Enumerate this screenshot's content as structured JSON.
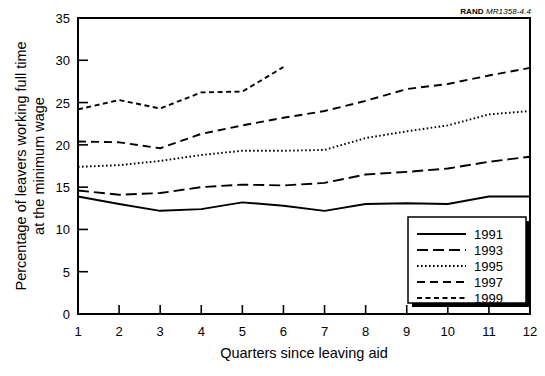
{
  "source_label": {
    "org": "RAND",
    "code": "MR1358-4.4"
  },
  "chart_data": {
    "type": "line",
    "title": "",
    "xlabel": "Quarters since leaving aid",
    "ylabel": "Percentage of leavers working full time\nat the minimum wage",
    "ylabel_line1": "Percentage of leavers working full time",
    "ylabel_line2": "at the minimum wage",
    "x": [
      1,
      2,
      3,
      4,
      5,
      6,
      7,
      8,
      9,
      10,
      11,
      12
    ],
    "xtick_labels": [
      "1",
      "2",
      "3",
      "4",
      "5",
      "6",
      "7",
      "8",
      "9",
      "10",
      "11",
      "12"
    ],
    "ytick_labels": [
      "0",
      "5",
      "10",
      "15",
      "20",
      "25",
      "30",
      "35"
    ],
    "yticks": [
      0,
      5,
      10,
      15,
      20,
      25,
      30,
      35
    ],
    "xlim": [
      1,
      12
    ],
    "ylim": [
      0,
      35
    ],
    "grid": false,
    "legend_position": "bottom-right",
    "series": [
      {
        "name": "1991",
        "style": "solid",
        "dash": "none",
        "values": [
          13.9,
          13.0,
          12.2,
          12.4,
          13.2,
          12.8,
          12.2,
          13.0,
          13.1,
          13.0,
          13.9,
          13.9
        ]
      },
      {
        "name": "1993",
        "style": "long-dash",
        "dash": "11,5",
        "values": [
          14.6,
          14.1,
          14.3,
          15.0,
          15.3,
          15.2,
          15.5,
          16.5,
          16.8,
          17.2,
          18.0,
          18.6
        ]
      },
      {
        "name": "1995",
        "style": "dotted",
        "dash": "1.6,2.4",
        "values": [
          17.4,
          17.6,
          18.1,
          18.8,
          19.3,
          19.3,
          19.4,
          20.8,
          21.6,
          22.3,
          23.6,
          24.0
        ]
      },
      {
        "name": "1997",
        "style": "dashed",
        "dash": "8,5",
        "values": [
          20.4,
          20.3,
          19.6,
          21.3,
          22.3,
          23.2,
          24.0,
          25.2,
          26.6,
          27.2,
          28.2,
          29.1
        ]
      },
      {
        "name": "1999",
        "style": "short-dash",
        "dash": "5,3.5",
        "values": [
          24.2,
          25.3,
          24.3,
          26.2,
          26.3,
          29.2,
          null,
          null,
          null,
          null,
          null,
          null
        ]
      }
    ],
    "legend_entries": [
      {
        "label": "1991",
        "dash": "none"
      },
      {
        "label": "1993",
        "dash": "11,5"
      },
      {
        "label": "1995",
        "dash": "1.6,2.4"
      },
      {
        "label": "1997",
        "dash": "8,5"
      },
      {
        "label": "1999",
        "dash": "5,3.5"
      }
    ]
  },
  "colors": {
    "line": "#000000",
    "axis": "#000000",
    "background": "#ffffff",
    "legend_shadow": "#000000"
  }
}
